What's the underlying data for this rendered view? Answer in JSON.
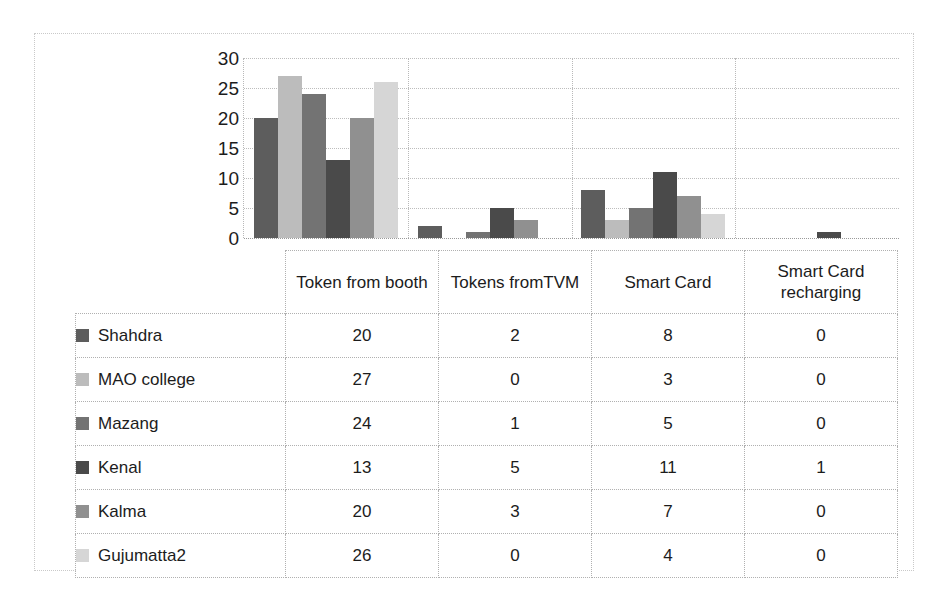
{
  "chart_data": {
    "type": "bar",
    "title": "",
    "subtitle": "",
    "xlabel": "",
    "ylabel": "",
    "ylim": [
      0,
      30
    ],
    "ytick_step": 5,
    "yticks": [
      30,
      25,
      20,
      15,
      10,
      5,
      0
    ],
    "grid": true,
    "legend_position": "table-left",
    "orientation": "vertical",
    "grouping": "clustered",
    "categories": [
      "Token from booth",
      "Tokens fromTVM",
      "Smart Card",
      "Smart Card recharging"
    ],
    "series": [
      {
        "name": "Shahdra",
        "color": "#5d5d5d",
        "values": [
          20,
          2,
          8,
          0
        ]
      },
      {
        "name": "MAO college",
        "color": "#bcbcbc",
        "values": [
          27,
          0,
          3,
          0
        ]
      },
      {
        "name": "Mazang",
        "color": "#737373",
        "values": [
          24,
          1,
          5,
          0
        ]
      },
      {
        "name": "Kenal",
        "color": "#4a4a4a",
        "values": [
          13,
          5,
          11,
          1
        ]
      },
      {
        "name": "Kalma",
        "color": "#909090",
        "values": [
          20,
          3,
          7,
          0
        ]
      },
      {
        "name": "Gujumatta2",
        "color": "#d6d6d6",
        "values": [
          26,
          0,
          4,
          0
        ]
      }
    ]
  },
  "table": {
    "header_blank": "",
    "headers": [
      "Token from booth",
      "Tokens fromTVM",
      "Smart Card",
      "Smart Card recharging"
    ],
    "rows": [
      {
        "label": "Shahdra",
        "swatch": "#5d5d5d",
        "values": [
          "20",
          "2",
          "8",
          "0"
        ]
      },
      {
        "label": "MAO college",
        "swatch": "#bcbcbc",
        "values": [
          "27",
          "0",
          "3",
          "0"
        ]
      },
      {
        "label": "Mazang",
        "swatch": "#737373",
        "values": [
          "24",
          "1",
          "5",
          "0"
        ]
      },
      {
        "label": "Kenal",
        "swatch": "#4a4a4a",
        "values": [
          "13",
          "5",
          "11",
          "1"
        ]
      },
      {
        "label": "Kalma",
        "swatch": "#909090",
        "values": [
          "20",
          "3",
          "7",
          "0"
        ]
      },
      {
        "label": "Gujumatta2",
        "swatch": "#d6d6d6",
        "values": [
          "26",
          "0",
          "4",
          "0"
        ]
      }
    ]
  }
}
